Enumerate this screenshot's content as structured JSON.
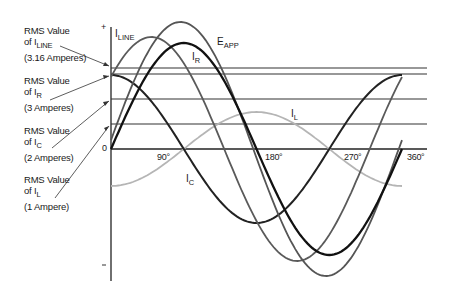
{
  "axis": {
    "plus_sign": "+",
    "minus_sign": "-",
    "zero_label": "0",
    "ticks": [
      "90°",
      "180°",
      "270°",
      "360°"
    ]
  },
  "rms_labels": [
    {
      "line1": "RMS Value",
      "of": "of I",
      "sub": "LINE",
      "value": "(3.16 Amperes)"
    },
    {
      "line1": "RMS Value",
      "of": "of I",
      "sub": "R",
      "value": "(3 Amperes)"
    },
    {
      "line1": "RMS Value",
      "of": "of I",
      "sub": "C",
      "value": "(2 Amperes)"
    },
    {
      "line1": "RMS Value",
      "of": "of I",
      "sub": "L",
      "value": "(1 Ampere)"
    }
  ],
  "curve_labels": {
    "iline": {
      "main": "I",
      "sub": "LINE"
    },
    "eapp": {
      "main": "E",
      "sub": "APP"
    },
    "ir": {
      "main": "I",
      "sub": "R"
    },
    "il": {
      "main": "I",
      "sub": "L"
    },
    "ic": {
      "main": "I",
      "sub": "C"
    }
  },
  "colors": {
    "axis": "#222222",
    "eapp": "#555555",
    "iline": "#5a5a5a",
    "ir": "#111111",
    "ic": "#222222",
    "il": "#b5b5b5",
    "rms": "#333333"
  }
}
